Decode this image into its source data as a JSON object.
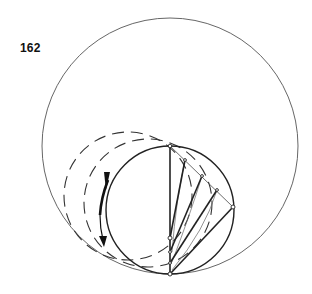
{
  "figure": {
    "number": "162",
    "colors": {
      "stroke": "#222222",
      "thin_stroke": "#555555",
      "background": "#ffffff"
    }
  },
  "geometry": {
    "large_circle": {
      "cx": 170,
      "cy": 146,
      "r": 128
    },
    "rolling_circle": {
      "cx": 170,
      "cy": 210,
      "r": 64
    },
    "dashed_circles": [
      {
        "cx": 128,
        "cy": 196,
        "r": 64
      },
      {
        "cx": 148,
        "cy": 203,
        "r": 64
      }
    ],
    "vertical_diameter": {
      "x": 170,
      "y1": 146,
      "y2": 274
    },
    "chord_top": [
      170,
      146
    ],
    "chord_points": [
      [
        185,
        160
      ],
      [
        202,
        176
      ],
      [
        217,
        190
      ],
      [
        233,
        207
      ]
    ],
    "diameter_points": [
      [
        170,
        238
      ],
      [
        170,
        252
      ],
      [
        170,
        263
      ],
      [
        170,
        274
      ]
    ]
  }
}
